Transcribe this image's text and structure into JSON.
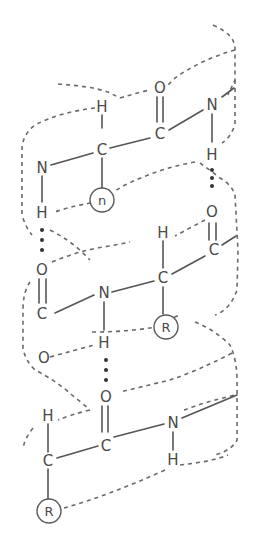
{
  "diagram": {
    "atoms": {
      "top_H_alpha": "H",
      "top_O": "O",
      "top_N_right": "N",
      "top_C_carbonyl": "C",
      "top_C_alpha": "C",
      "top_N_left": "N",
      "top_H_left": "H",
      "top_H_right": "H",
      "top_R": "n",
      "mid_O_right": "O",
      "mid_C_right": "C",
      "mid_H_alpha": "H",
      "mid_C_alpha": "C",
      "mid_O_left": "O",
      "mid_C_left": "C",
      "mid_N": "N",
      "mid_H_N": "H",
      "mid_R": "R",
      "mid_O_lower_left": "O",
      "bot_O": "O",
      "bot_C_carbonyl": "C",
      "bot_N": "N",
      "bot_H_N": "H",
      "bot_H_alpha": "H",
      "bot_C_alpha": "C",
      "bot_R": "R"
    },
    "colors": {
      "line": "#555555",
      "helix_ribbon": "#6a6a6a",
      "hydrogen_bond_dots": "#333333",
      "background": "#ffffff"
    }
  }
}
